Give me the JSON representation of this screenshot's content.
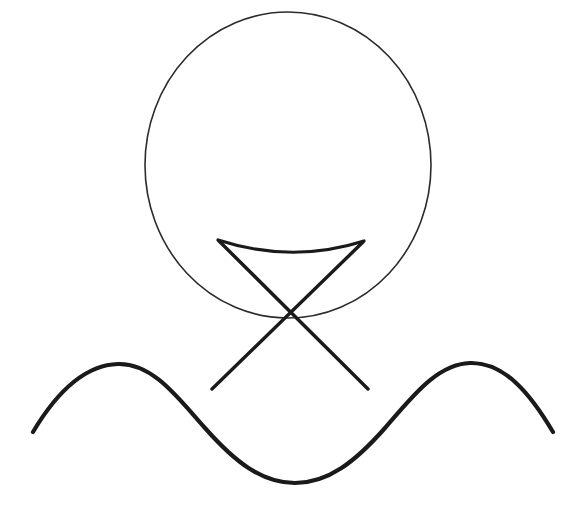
{
  "canvas": {
    "width": 581,
    "height": 511,
    "background_color": "#ffffff",
    "description": "Hand-drawn black line sketch on white background"
  },
  "palette": {
    "ink": "#1a1a1a",
    "ink_thin": "#2b2b2b",
    "paper": "#ffffff"
  },
  "shapes": {
    "circle": {
      "name": "circle",
      "center_x": 288,
      "center_y": 165,
      "radius": 143,
      "stroke_color": "#2b2b2b",
      "stroke_width": 1.6,
      "fill": "none",
      "path": "M 145 165 A 143 153 0 1 1 431 165 A 143 153 0 1 1 145 165"
    },
    "arc": {
      "name": "downward-arc",
      "start_x": 218,
      "start_y": 240,
      "end_x": 364,
      "end_y": 241,
      "sag_y": 256,
      "stroke_color": "#1a1a1a",
      "stroke_width": 3.2,
      "path": "M 218 240 Q 292 264 364 241"
    },
    "cross_stroke_a": {
      "name": "cross-stroke-left-to-right",
      "start_x": 219,
      "start_y": 241,
      "end_x": 368,
      "end_y": 389,
      "stroke_color": "#1a1a1a",
      "stroke_width": 3.4,
      "path": "M 219 241 L 368 389"
    },
    "cross_stroke_b": {
      "name": "cross-stroke-right-to-left",
      "start_x": 363,
      "start_y": 242,
      "end_x": 212,
      "end_y": 389,
      "stroke_color": "#1a1a1a",
      "stroke_width": 3.4,
      "path": "M 363 242 L 212 389"
    },
    "wave": {
      "name": "sine-wave",
      "start_x": 33,
      "start_y": 432,
      "end_x": 553,
      "end_y": 432,
      "peak_left_x": 118,
      "peak_left_y": 364,
      "trough_x": 295,
      "trough_y": 483,
      "peak_right_x": 470,
      "peak_right_y": 363,
      "stroke_color": "#1a1a1a",
      "stroke_width": 4.2,
      "path": "M 33 432 C 55 395 83 365 118 364 C 153 363 178 398 205 428 C 235 462 262 483 295 483 C 328 483 355 462 385 428 C 412 397 437 364 470 363 C 505 362 531 395 553 432"
    }
  },
  "shape_order": [
    "circle",
    "arc",
    "cross_stroke_a",
    "cross_stroke_b",
    "wave"
  ]
}
